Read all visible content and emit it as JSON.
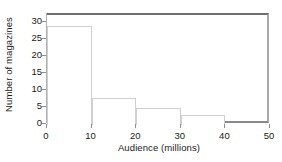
{
  "chart_data": {
    "type": "bar",
    "title": "",
    "subtitle": "",
    "xlabel": "Audience (millions)",
    "ylabel": "Number of magazines",
    "grid": false,
    "legend": "none",
    "xlim": [
      0,
      50
    ],
    "ylim": [
      0,
      30
    ],
    "xticks": [
      0,
      10,
      20,
      30,
      40,
      50
    ],
    "yticks": [
      0,
      5,
      10,
      15,
      20,
      25,
      30
    ],
    "xtick_labels": [
      "0",
      "10",
      "20",
      "30",
      "40",
      "50"
    ],
    "ytick_labels": [
      "0",
      "5",
      "10",
      "15",
      "20",
      "25",
      "30"
    ],
    "bin_edges": [
      0,
      10,
      20,
      30,
      40
    ],
    "categories": [
      "0-10",
      "10-20",
      "20-30",
      "30-40"
    ],
    "values": [
      29,
      8,
      5,
      3
    ],
    "bar_fill": "#ffffff",
    "bar_outline": "#cfcfcf",
    "frame_color": "#6e6e6e",
    "axis_color": "#8f8f8f",
    "text_color": "#1a1a1a",
    "background": "#ffffff"
  }
}
